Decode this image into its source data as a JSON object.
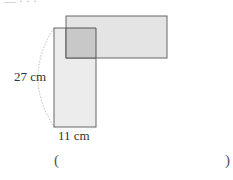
{
  "figure": {
    "horizontal_rect": {
      "x": 66,
      "y": 16,
      "w": 101,
      "h": 42,
      "fill": "#e4e4e4",
      "stroke": "#666666"
    },
    "vertical_rect": {
      "x": 54,
      "y": 28,
      "w": 42,
      "h": 99,
      "fill": "#ececec",
      "stroke": "#666666"
    },
    "overlap": {
      "x": 66,
      "y": 28,
      "w": 30,
      "h": 30,
      "fill": "#c8c8c8"
    },
    "height_label": "27 cm",
    "width_label": "11 cm"
  },
  "answer": {
    "open_paren": "(",
    "close_paren": ")",
    "value": ""
  },
  "top_fragment": "— · · ·"
}
